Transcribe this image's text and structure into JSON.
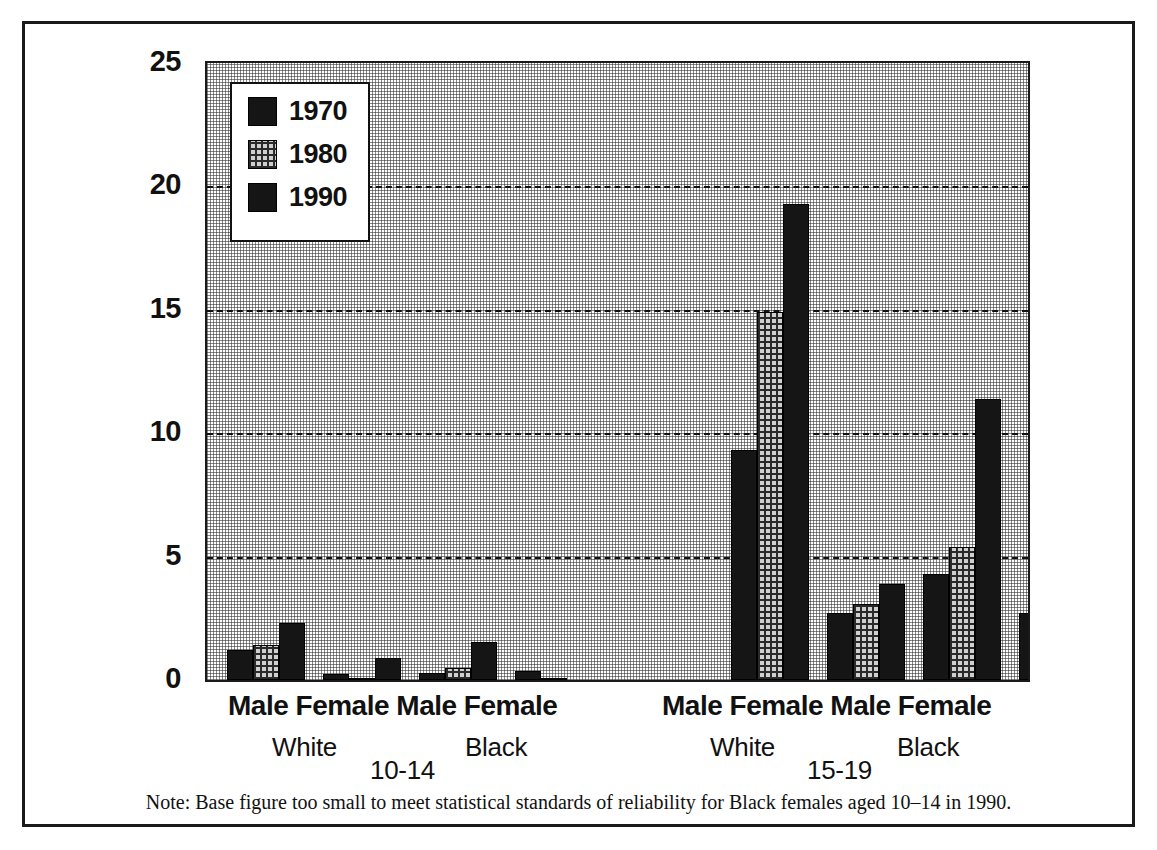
{
  "chart_data": {
    "type": "bar",
    "title": "",
    "subtitle": "",
    "xlabel": "",
    "ylabel": "",
    "ylim": [
      0,
      25
    ],
    "yticks": [
      0,
      5,
      10,
      15,
      20,
      25
    ],
    "grid": true,
    "grid_values": [
      5,
      10,
      15,
      20
    ],
    "legend_position": "top-left",
    "legend": [
      {
        "label": "1970",
        "pattern": "solid"
      },
      {
        "label": "1980",
        "pattern": "hatch"
      },
      {
        "label": "1990",
        "pattern": "solid"
      }
    ],
    "series": [
      {
        "name": "1970",
        "pattern": "solid",
        "values": [
          1.2,
          0.25,
          0.3,
          0.35,
          9.3,
          2.7,
          4.3,
          2.7
        ]
      },
      {
        "name": "1980",
        "pattern": "hatch",
        "values": [
          1.4,
          0.1,
          0.5,
          0.05,
          14.9,
          3.1,
          5.4,
          1.5
        ]
      },
      {
        "name": "1990",
        "pattern": "solid",
        "values": [
          2.3,
          0.9,
          1.55,
          0.0,
          19.3,
          3.9,
          11.4,
          1.7
        ]
      }
    ],
    "categories": [
      {
        "sex": "Male",
        "race": "White",
        "age": "10-14"
      },
      {
        "sex": "Female",
        "race": "White",
        "age": "10-14"
      },
      {
        "sex": "Male",
        "race": "Black",
        "age": "10-14"
      },
      {
        "sex": "Female",
        "race": "Black",
        "age": "10-14"
      },
      {
        "sex": "Male",
        "race": "White",
        "age": "15-19"
      },
      {
        "sex": "Female",
        "race": "White",
        "age": "15-19"
      },
      {
        "sex": "Male",
        "race": "Black",
        "age": "15-19"
      },
      {
        "sex": "Female",
        "race": "Black",
        "age": "15-19"
      }
    ],
    "age_groups": [
      "10-14",
      "15-19"
    ],
    "note": "Note: Base figure too small to meet statistical standards of reliability for Black females aged 10–14 in 1990."
  },
  "axis": {
    "labels": [
      "25",
      "20",
      "15",
      "10",
      "5",
      "0"
    ]
  },
  "xlabels": {
    "group_10_14": {
      "sexes": "Male Female Male Female",
      "white": "White",
      "black": "Black",
      "age": "10-14"
    },
    "group_15_19": {
      "sexes": "Male Female Male Female",
      "white": "White",
      "black": "Black",
      "age": "15-19"
    }
  },
  "colors": {
    "ink": "#111111",
    "bar_solid": "#151515",
    "bar_hatch_base": "#cfcfcf",
    "frame": "#1a1a1a"
  }
}
